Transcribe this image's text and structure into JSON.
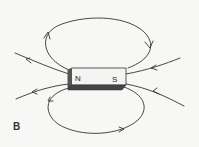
{
  "figure": {
    "label": "B",
    "magnet": {
      "north_label": "N",
      "south_label": "S",
      "face_color": "#f4f4f2",
      "shadow_color": "#444444"
    },
    "line_color": "#333333"
  }
}
